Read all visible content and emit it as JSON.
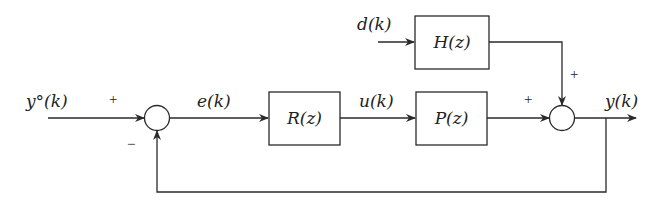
{
  "diagram": {
    "type": "feedback control block diagram",
    "signals": {
      "reference": "y°(k)",
      "error": "e(k)",
      "control": "u(k)",
      "disturbance": "d(k)",
      "output": "y(k)"
    },
    "blocks": {
      "controller": "R(z)",
      "plant": "P(z)",
      "disturbance_filter": "H(z)"
    },
    "signs": {
      "sum1_reference": "+",
      "sum1_feedback": "−",
      "sum2_plant": "+",
      "sum2_disturbance": "+"
    }
  }
}
